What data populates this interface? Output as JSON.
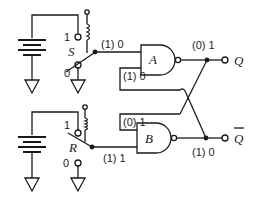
{
  "diagram": {
    "type": "SR latch with NAND gates and switch inputs",
    "gates": [
      {
        "id": "A",
        "label": "A",
        "type": "NAND"
      },
      {
        "id": "B",
        "label": "B",
        "type": "NAND"
      }
    ],
    "switches": [
      {
        "id": "S",
        "label": "S",
        "pos1": "1",
        "pos0": "0"
      },
      {
        "id": "R",
        "label": "R",
        "pos1": "1",
        "pos0": "0"
      }
    ],
    "outputs": [
      {
        "id": "Q",
        "label": "Q"
      },
      {
        "id": "Qbar",
        "label": "Q"
      }
    ],
    "values": {
      "s_line": "(1) 0",
      "a_feedback_input": "(1) 0",
      "q_out": "(0) 1",
      "b_feedback_input": "(0) 1",
      "r_line": "(1) 1",
      "qbar_out": "(1) 0"
    }
  }
}
